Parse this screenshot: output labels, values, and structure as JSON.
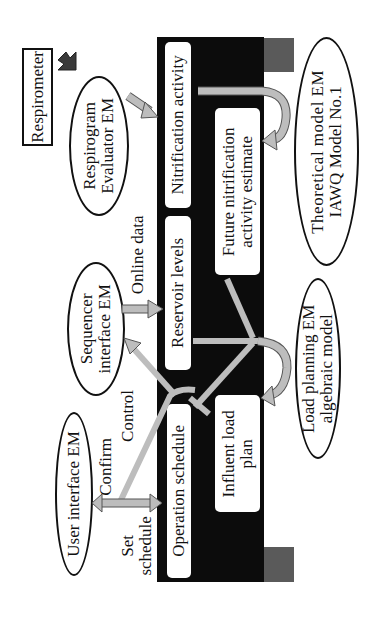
{
  "diagram": {
    "orientation": "rotated-90-ccw",
    "external_nodes": {
      "respirometer": "Respirometer",
      "respirogram_evaluator": [
        "Respirogram",
        "Evaluator EM"
      ],
      "sequencer_interface": [
        "Sequencer",
        "interface EM"
      ],
      "user_interface": "User interface EM",
      "theoretical_model": [
        "Theoretical model EM",
        "IAWQ Model No.1"
      ],
      "load_planning": [
        "Load planning EM",
        "algebraic model"
      ]
    },
    "database_boxes": {
      "nitrification_activity": "Nitrification activity",
      "reservoir_levels": "Reservoir levels",
      "operation_schedule": "Operation schedule",
      "future_nitrification": [
        "Future nitrification",
        "activity estimate"
      ],
      "influent_load_plan": [
        "Influent load",
        "plan"
      ]
    },
    "edge_labels": {
      "online_data": "Online data",
      "control": "Control",
      "confirm": "Confirm",
      "set_schedule": [
        "Set",
        "schedule"
      ]
    },
    "colors": {
      "bar": "#0c0c0c",
      "grey_block": "#5a5a5a",
      "arrow_fill": "#bdbdbd",
      "dark_arrow": "#3a3a3a"
    }
  }
}
